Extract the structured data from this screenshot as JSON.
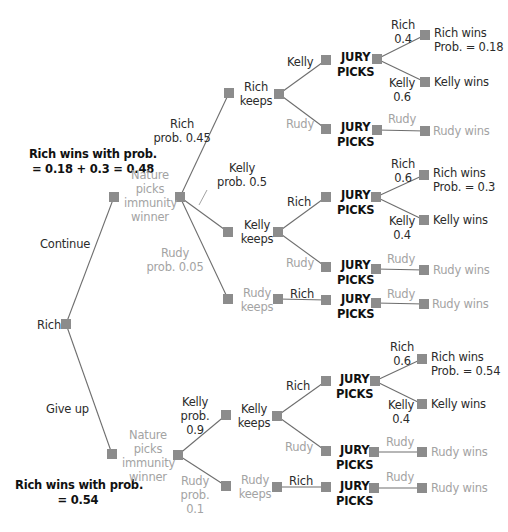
{
  "diagram": {
    "type": "game-tree",
    "colors": {
      "line": "#6e6e6e",
      "node": "#8c8c8c",
      "text": "#2b2b2b",
      "muted_text": "#a3a3a3",
      "bold_text": "#111111"
    },
    "root": {
      "label": "Rich"
    },
    "summaries": {
      "continue": {
        "line1": "Rich wins with prob.",
        "line2": "= 0.18 + 0.3 = 0.48"
      },
      "give_up": {
        "line1": "Rich wins with prob.",
        "line2": "= 0.54"
      }
    },
    "root_moves": {
      "continue": "Continue",
      "give_up": "Give up"
    },
    "nature": {
      "line1": "Nature",
      "line2": "picks",
      "line3": "immunity",
      "line4": "winner"
    },
    "jury_label": {
      "line1": "JURY",
      "line2": "PICKS"
    },
    "continue_branch": {
      "nature_moves": {
        "rich": {
          "name": "Rich",
          "prob": "prob. 0.45"
        },
        "kelly": {
          "name": "Kelly",
          "prob": "prob. 0.5"
        },
        "rudy": {
          "name": "Rudy",
          "prob": "prob. 0.05"
        }
      },
      "rich_keeps": {
        "label1": "Rich",
        "label2": "keeps",
        "moves": {
          "kelly": "Kelly",
          "rudy": "Rudy"
        },
        "jury_kelly": {
          "rich_move": {
            "name": "Rich",
            "prob": "0.4"
          },
          "kelly_move": {
            "name": "Kelly",
            "prob": "0.6"
          },
          "rich_wins": "Rich wins",
          "rich_wins_prob": "Prob. = 0.18",
          "kelly_wins": "Kelly wins"
        },
        "jury_rudy": {
          "move": "Rudy",
          "outcome": "Rudy wins"
        }
      },
      "kelly_keeps": {
        "label1": "Kelly",
        "label2": "keeps",
        "moves": {
          "rich": "Rich",
          "rudy": "Rudy"
        },
        "jury_rich": {
          "rich_move": {
            "name": "Rich",
            "prob": "0.6"
          },
          "kelly_move": {
            "name": "Kelly",
            "prob": "0.4"
          },
          "rich_wins": "Rich wins",
          "rich_wins_prob": "Prob. = 0.3",
          "kelly_wins": "Kelly wins"
        },
        "jury_rudy": {
          "move": "Rudy",
          "outcome": "Rudy wins"
        }
      },
      "rudy_keeps": {
        "label1": "Rudy",
        "label2": "keeps",
        "move": "Rich",
        "jury": {
          "move": "Rudy",
          "outcome": "Rudy wins"
        }
      }
    },
    "give_up_branch": {
      "nature_moves": {
        "kelly": {
          "line1": "Kelly",
          "line2": "prob.",
          "line3": "0.9"
        },
        "rudy": {
          "line1": "Rudy",
          "line2": "prob.",
          "line3": "0.1"
        }
      },
      "kelly_keeps": {
        "label1": "Kelly",
        "label2": "keeps",
        "moves": {
          "rich": "Rich",
          "rudy": "Rudy"
        },
        "jury_rich": {
          "rich_move": {
            "name": "Rich",
            "prob": "0.6"
          },
          "kelly_move": {
            "name": "Kelly",
            "prob": "0.4"
          },
          "rich_wins": "Rich wins",
          "rich_wins_prob": "Prob. = 0.54",
          "kelly_wins": "Kelly wins"
        },
        "jury_rudy": {
          "move": "Rudy",
          "outcome": "Rudy wins"
        }
      },
      "rudy_keeps": {
        "label1": "Rudy",
        "label2": "keeps",
        "move": "Rich",
        "jury": {
          "move": "Rudy",
          "outcome": "Rudy wins"
        }
      }
    }
  }
}
